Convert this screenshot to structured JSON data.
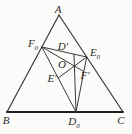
{
  "diagram": {
    "background_color": "#fbfbf9",
    "stroke_color": "#3a3a3a",
    "base_stroke_color": "#1e1e1e",
    "label_color": "#2b2b2b",
    "canvas": {
      "width": 132,
      "height": 134
    },
    "points": {
      "A": [
        59,
        15
      ],
      "B": [
        7,
        112
      ],
      "C": [
        123,
        112
      ],
      "F0": [
        41.9,
        47
      ],
      "E0": [
        86.7,
        57
      ],
      "D0": [
        76,
        112
      ],
      "Dp": [
        74,
        54.2
      ],
      "Ep": [
        58.2,
        78
      ],
      "Fp": [
        83.9,
        71.6
      ],
      "O": [
        74.4,
        66.1
      ]
    },
    "segments": [
      {
        "name": "side-AB",
        "from": "A",
        "to": "B",
        "width": 1.2,
        "role": "side"
      },
      {
        "name": "side-AC",
        "from": "A",
        "to": "C",
        "width": 1.2,
        "role": "side"
      },
      {
        "name": "side-BC",
        "from": "B",
        "to": "C",
        "width": 1.8,
        "role": "base"
      },
      {
        "name": "segment-F0-E0",
        "from": "F0",
        "to": "E0",
        "width": 1,
        "role": "inner"
      },
      {
        "name": "segment-F0-D0",
        "from": "F0",
        "to": "D0",
        "width": 1,
        "role": "inner"
      },
      {
        "name": "segment-E0-D0",
        "from": "E0",
        "to": "D0",
        "width": 1,
        "role": "inner"
      },
      {
        "name": "segment-Dp-D0",
        "from": "Dp",
        "to": "D0",
        "width": 1,
        "role": "inner"
      },
      {
        "name": "segment-E0-Ep",
        "from": "E0",
        "to": "Ep",
        "width": 1,
        "role": "inner"
      },
      {
        "name": "segment-F0-Fp",
        "from": "F0",
        "to": "Fp",
        "width": 1,
        "role": "inner"
      }
    ],
    "labels": [
      {
        "name": "label-A",
        "text": "A",
        "sub": "",
        "x": 58,
        "y": 13
      },
      {
        "name": "label-B",
        "text": "B",
        "sub": "",
        "x": 6,
        "y": 124
      },
      {
        "name": "label-C",
        "text": "C",
        "sub": "",
        "x": 121,
        "y": 124
      },
      {
        "name": "label-D0",
        "text": "D",
        "sub": "0",
        "x": 74,
        "y": 125
      },
      {
        "name": "label-F0",
        "text": "F",
        "sub": "0",
        "x": 33,
        "y": 47
      },
      {
        "name": "label-E0",
        "text": "E",
        "sub": "0",
        "x": 95,
        "y": 56
      },
      {
        "name": "label-D-prime",
        "text": "D′",
        "sub": "",
        "x": 63,
        "y": 50
      },
      {
        "name": "label-O",
        "text": "O",
        "sub": "",
        "x": 62,
        "y": 68
      },
      {
        "name": "label-E-prime",
        "text": "E′",
        "sub": "",
        "x": 52,
        "y": 82
      },
      {
        "name": "label-F-prime",
        "text": "F′",
        "sub": "",
        "x": 85,
        "y": 79
      }
    ]
  }
}
